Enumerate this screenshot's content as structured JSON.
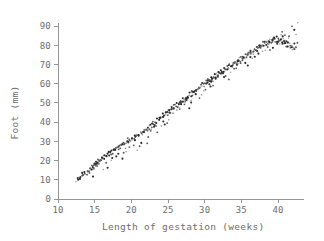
{
  "figure": {
    "background_color": "#ffffff",
    "axis_color": "#8c8c8c",
    "text_color": "#6e6e6e",
    "point_color_dark": "#2b2b2b",
    "point_color_mid": "#585858",
    "point_color_light": "#9a9a9a"
  },
  "chart_data": {
    "type": "scatter",
    "title": "",
    "xlabel": "Length of gestation (weeks)",
    "ylabel": "Foot (mm)",
    "xlim": [
      9.2,
      43.6
    ],
    "ylim": [
      -1.5,
      94
    ],
    "xticks": [
      10,
      15,
      20,
      25,
      30,
      35,
      40
    ],
    "xticklabels": [
      "10",
      "15",
      "20",
      "25",
      "30",
      "35",
      "40"
    ],
    "yticks": [
      0,
      10,
      20,
      30,
      40,
      50,
      60,
      70,
      80,
      90
    ],
    "yticklabels": [
      "0",
      "10",
      "20",
      "30",
      "40",
      "50",
      "60",
      "70",
      "80",
      "90"
    ],
    "grid": false,
    "legend": null,
    "n_points": 432,
    "marker_size_px": 1.5,
    "x": [
      12.4,
      12.6,
      12.7,
      12.9,
      13.0,
      13.1,
      13.3,
      13.4,
      13.5,
      13.6,
      13.7,
      13.8,
      13.9,
      14.0,
      14.1,
      14.2,
      14.3,
      14.4,
      14.5,
      14.5,
      14.6,
      14.7,
      14.8,
      14.8,
      14.9,
      15.0,
      15.0,
      15.1,
      15.2,
      15.2,
      15.3,
      15.4,
      15.5,
      15.5,
      15.6,
      15.7,
      15.8,
      15.9,
      16.0,
      16.0,
      16.1,
      16.2,
      16.3,
      16.4,
      16.5,
      16.6,
      16.7,
      16.8,
      16.9,
      17.0,
      17.1,
      17.2,
      17.3,
      17.4,
      17.5,
      17.6,
      17.7,
      17.8,
      17.9,
      18.0,
      18.1,
      18.2,
      18.3,
      18.4,
      18.5,
      18.6,
      18.7,
      18.8,
      18.9,
      19.0,
      19.1,
      19.2,
      19.3,
      19.4,
      19.5,
      19.6,
      19.7,
      19.8,
      19.9,
      20.0,
      20.1,
      20.2,
      20.3,
      20.4,
      20.5,
      20.6,
      20.7,
      20.8,
      20.9,
      21.0,
      21.1,
      21.2,
      21.3,
      21.4,
      21.5,
      21.6,
      21.7,
      21.8,
      21.9,
      22.0,
      22.1,
      22.2,
      22.3,
      22.4,
      22.5,
      22.6,
      22.7,
      22.8,
      22.9,
      23.0,
      23.1,
      23.2,
      23.3,
      23.4,
      23.5,
      23.6,
      23.7,
      23.8,
      23.9,
      24.0,
      24.1,
      24.2,
      24.3,
      24.4,
      24.5,
      24.6,
      24.7,
      24.8,
      24.9,
      25.0,
      25.1,
      25.2,
      25.3,
      25.4,
      25.5,
      25.6,
      25.7,
      25.8,
      25.9,
      26.0,
      26.1,
      26.2,
      26.3,
      26.4,
      26.5,
      26.6,
      26.7,
      26.8,
      26.9,
      27.0,
      27.1,
      27.2,
      27.3,
      27.4,
      27.5,
      27.6,
      27.7,
      27.8,
      27.9,
      28.0,
      28.1,
      28.2,
      28.3,
      28.4,
      28.5,
      28.6,
      28.7,
      28.8,
      28.9,
      29.0,
      29.1,
      29.2,
      29.3,
      29.4,
      29.5,
      29.6,
      29.7,
      29.8,
      29.9,
      30.0,
      30.1,
      30.2,
      30.3,
      30.4,
      30.5,
      30.6,
      30.7,
      30.8,
      30.9,
      31.0,
      31.1,
      31.2,
      31.3,
      31.4,
      31.5,
      31.6,
      31.7,
      31.8,
      31.9,
      32.0,
      32.1,
      32.2,
      32.3,
      32.4,
      32.5,
      32.6,
      32.7,
      32.8,
      32.9,
      33.0,
      33.1,
      33.2,
      33.3,
      33.4,
      33.5,
      33.6,
      33.7,
      33.8,
      33.9,
      34.0,
      34.1,
      34.2,
      34.3,
      34.4,
      34.5,
      34.6,
      34.7,
      34.8,
      34.9,
      35.0,
      35.1,
      35.2,
      35.3,
      35.4,
      35.5,
      35.6,
      35.7,
      35.8,
      35.9,
      36.0,
      36.1,
      36.2,
      36.3,
      36.4,
      36.5,
      36.6,
      36.7,
      36.8,
      36.9,
      37.0,
      37.1,
      37.2,
      37.3,
      37.4,
      37.5,
      37.6,
      37.7,
      37.8,
      37.9,
      38.0,
      38.1,
      38.2,
      38.3,
      38.4,
      38.5,
      38.6,
      38.7,
      38.8,
      38.9,
      39.0,
      39.1,
      39.2,
      39.3,
      39.4,
      39.5,
      39.6,
      39.7,
      39.8,
      39.9,
      40.0,
      40.1,
      40.2,
      40.3,
      40.4,
      40.5,
      40.6,
      40.7,
      40.8,
      40.9,
      41.0,
      41.1,
      41.2,
      41.3,
      41.4,
      41.5,
      41.6,
      41.7,
      41.8,
      41.9,
      42.0,
      42.1,
      42.2,
      42.3,
      42.4,
      42.5,
      13.2,
      14.4,
      15.3,
      16.6,
      17.4,
      18.3,
      19.2,
      20.4,
      21.3,
      22.6,
      23.4,
      24.3,
      25.6,
      26.4,
      27.3,
      28.6,
      29.4,
      30.3,
      31.6,
      32.4,
      33.3,
      34.6,
      35.4,
      36.3,
      37.6,
      38.4,
      39.3,
      40.6,
      41.4,
      42.3,
      14.8,
      16.2,
      18.7,
      20.9,
      22.1,
      24.8,
      26.7,
      28.2,
      30.7,
      32.9,
      34.1,
      36.8,
      38.9,
      40.2,
      41.8,
      15.6,
      17.9,
      19.6,
      21.7,
      23.8,
      25.4,
      27.6,
      29.8,
      31.2,
      33.7,
      35.8,
      37.2,
      39.6,
      41.2,
      42.4,
      16.8,
      19.4,
      23.2,
      26.2,
      28.8,
      31.8,
      34.4,
      36.6,
      38.2,
      40.8,
      22.4,
      25.2,
      27.8,
      30.2,
      33.2,
      35.2,
      37.8,
      39.8,
      41.6,
      29.2,
      24.6,
      26.8,
      28.4,
      30.6,
      32.2,
      34.8,
      36.2,
      38.6,
      40.4,
      42.2,
      20.6,
      22.8,
      24.2,
      27.2,
      29.6,
      31.4,
      33.6,
      35.6,
      37.4,
      39.2,
      41.0,
      42.6,
      18.9,
      21.1,
      23.6,
      25.8,
      28.1,
      30.9,
      32.6,
      34.2,
      36.4,
      38.8,
      40.6,
      42.8,
      17.2,
      19.8,
      26.6,
      31.1,
      35.9,
      39.4,
      41.9
    ],
    "y": [
      9.5,
      10.2,
      10.0,
      11.0,
      11.4,
      11.0,
      12.2,
      12.0,
      13.0,
      12.6,
      13.4,
      13.8,
      13.0,
      14.2,
      14.6,
      14.0,
      15.2,
      15.6,
      15.0,
      16.4,
      16.0,
      16.8,
      15.4,
      17.2,
      17.0,
      16.2,
      17.8,
      18.2,
      17.4,
      18.8,
      18.0,
      19.2,
      18.6,
      19.8,
      19.0,
      20.2,
      19.6,
      20.8,
      20.0,
      21.4,
      20.6,
      21.8,
      21.0,
      22.4,
      22.0,
      22.8,
      22.2,
      23.4,
      23.0,
      23.8,
      23.2,
      24.4,
      24.0,
      24.8,
      24.2,
      25.4,
      25.0,
      25.8,
      25.2,
      26.4,
      26.0,
      26.8,
      26.2,
      27.4,
      27.0,
      27.8,
      27.2,
      28.4,
      28.0,
      28.8,
      28.2,
      29.4,
      29.0,
      29.8,
      29.2,
      30.4,
      30.0,
      30.8,
      30.2,
      31.4,
      31.0,
      31.8,
      31.2,
      32.4,
      32.0,
      32.8,
      32.2,
      33.4,
      33.0,
      33.8,
      33.2,
      34.4,
      34.0,
      34.8,
      34.2,
      35.4,
      35.0,
      35.8,
      35.2,
      36.4,
      36.0,
      37.0,
      36.2,
      37.8,
      37.2,
      38.4,
      37.6,
      39.0,
      38.2,
      39.6,
      38.8,
      40.2,
      39.4,
      40.8,
      40.0,
      41.4,
      40.6,
      42.0,
      41.2,
      42.6,
      41.8,
      43.2,
      42.4,
      44.0,
      43.0,
      44.6,
      43.6,
      45.2,
      44.2,
      45.8,
      44.8,
      46.4,
      45.4,
      47.0,
      46.0,
      47.6,
      46.6,
      48.2,
      47.2,
      48.8,
      47.8,
      49.4,
      48.4,
      50.0,
      49.0,
      50.6,
      49.6,
      51.2,
      50.2,
      51.8,
      50.8,
      52.4,
      51.4,
      53.0,
      52.0,
      53.6,
      52.6,
      54.2,
      53.2,
      54.8,
      53.8,
      55.4,
      54.4,
      56.0,
      55.0,
      56.6,
      55.6,
      57.2,
      56.2,
      57.8,
      56.8,
      58.4,
      57.4,
      59.0,
      58.0,
      59.6,
      58.6,
      60.2,
      59.2,
      60.8,
      59.8,
      61.2,
      60.4,
      61.8,
      61.0,
      62.4,
      61.4,
      63.0,
      62.0,
      63.4,
      62.6,
      64.0,
      63.2,
      64.4,
      63.6,
      65.0,
      64.2,
      65.4,
      64.8,
      66.0,
      65.2,
      66.4,
      65.8,
      67.0,
      66.2,
      67.4,
      66.8,
      68.0,
      67.2,
      68.4,
      67.8,
      69.0,
      68.2,
      69.4,
      68.8,
      70.0,
      69.2,
      70.4,
      69.8,
      71.0,
      70.2,
      71.4,
      70.8,
      72.0,
      71.2,
      72.4,
      71.8,
      73.0,
      72.2,
      73.4,
      72.8,
      74.0,
      73.2,
      74.4,
      73.8,
      75.0,
      74.2,
      75.4,
      74.8,
      76.0,
      75.2,
      76.4,
      75.8,
      77.0,
      76.2,
      77.4,
      76.8,
      78.0,
      77.2,
      78.4,
      77.8,
      79.0,
      78.2,
      79.4,
      78.8,
      80.0,
      79.2,
      80.4,
      79.6,
      81.0,
      80.0,
      81.4,
      80.4,
      81.8,
      80.8,
      82.2,
      81.0,
      82.6,
      81.4,
      83.0,
      81.6,
      83.2,
      81.8,
      83.4,
      82.0,
      83.6,
      82.2,
      83.8,
      82.4,
      84.0,
      82.0,
      83.4,
      81.6,
      83.0,
      81.2,
      82.6,
      80.8,
      82.2,
      80.4,
      81.8,
      80.0,
      81.4,
      79.6,
      81.0,
      79.2,
      80.6,
      78.8,
      80.2,
      78.4,
      79.8,
      78.0,
      79.4,
      77.6,
      79.0,
      78.6,
      13.5,
      15.8,
      17.0,
      19.0,
      22.0,
      24.0,
      26.0,
      28.0,
      30.0,
      35.0,
      38.0,
      41.0,
      45.0,
      48.0,
      51.0,
      56.0,
      58.0,
      60.0,
      64.0,
      66.0,
      68.0,
      72.0,
      74.0,
      76.0,
      79.0,
      80.0,
      82.0,
      84.0,
      83.0,
      81.0,
      12.0,
      16.0,
      21.0,
      26.0,
      29.0,
      40.0,
      46.0,
      50.0,
      58.0,
      64.0,
      67.0,
      74.0,
      78.0,
      80.0,
      79.0,
      21.0,
      23.0,
      31.0,
      34.0,
      43.0,
      44.0,
      52.0,
      57.0,
      62.0,
      69.0,
      75.0,
      77.0,
      81.0,
      82.0,
      85.0,
      17.0,
      25.0,
      37.0,
      46.0,
      54.0,
      64.0,
      70.0,
      76.0,
      78.0,
      83.0,
      33.0,
      42.0,
      47.0,
      57.0,
      62.0,
      72.0,
      77.0,
      80.0,
      84.0,
      53.0,
      39.0,
      49.0,
      56.0,
      59.0,
      65.0,
      71.0,
      73.0,
      79.0,
      85.0,
      88.0,
      30.0,
      36.0,
      38.0,
      50.0,
      55.0,
      63.0,
      66.0,
      70.0,
      75.0,
      78.0,
      86.0,
      82.0,
      24.0,
      28.0,
      35.0,
      44.0,
      51.0,
      61.0,
      63.0,
      68.0,
      73.0,
      81.0,
      87.0,
      91.0,
      20.0,
      27.0,
      47.0,
      59.0,
      69.0,
      84.0,
      90.0
    ]
  }
}
